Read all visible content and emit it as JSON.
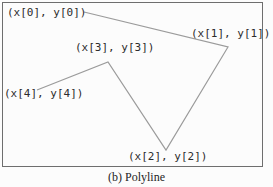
{
  "figure": {
    "caption": "(b) Polyline",
    "labels": [
      {
        "text": "(x[0], y[0])"
      },
      {
        "text": "(x[1], y[1])"
      },
      {
        "text": "(x[2], y[2])"
      },
      {
        "text": "(x[3], y[3])"
      },
      {
        "text": "(x[4], y[4])"
      }
    ],
    "polyline": {
      "points": [
        [
          84,
          12
        ],
        [
          228,
          47
        ],
        [
          166,
          150
        ],
        [
          108,
          62
        ],
        [
          37,
          90
        ]
      ],
      "stroke_color": "#9b9b9b",
      "stroke_width": 1.2
    },
    "colors": {
      "frame_border": "#6e6e6e",
      "label_text": "#2c2c2c",
      "caption_text": "#1f1f1f",
      "background": "#fcfcfc"
    }
  }
}
